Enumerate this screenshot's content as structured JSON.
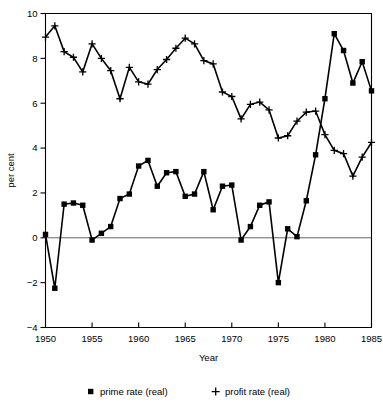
{
  "chart_data": {
    "type": "line",
    "title": "",
    "xlabel": "Year",
    "ylabel": "per cent",
    "xlim": [
      1950,
      1985
    ],
    "ylim": [
      -4,
      10
    ],
    "xticks": [
      1950,
      1955,
      1960,
      1965,
      1970,
      1975,
      1980,
      1985
    ],
    "yticks": [
      -4,
      -2,
      0,
      2,
      4,
      6,
      8,
      10
    ],
    "grid": false,
    "legend_position": "bottom",
    "zero_line": 0,
    "x": [
      1950,
      1951,
      1952,
      1953,
      1954,
      1955,
      1956,
      1957,
      1958,
      1959,
      1960,
      1961,
      1962,
      1963,
      1964,
      1965,
      1966,
      1967,
      1968,
      1969,
      1970,
      1971,
      1972,
      1973,
      1974,
      1975,
      1976,
      1977,
      1978,
      1979,
      1980,
      1981,
      1982,
      1983,
      1984,
      1985
    ],
    "series": [
      {
        "name": "prime rate (real)",
        "marker": "square",
        "values": [
          0.15,
          -2.25,
          1.5,
          1.55,
          1.45,
          -0.1,
          0.2,
          0.5,
          1.75,
          1.95,
          3.2,
          3.45,
          2.3,
          2.9,
          2.95,
          1.85,
          1.95,
          2.95,
          1.25,
          2.3,
          2.35,
          -0.1,
          0.5,
          1.45,
          1.6,
          -2.0,
          0.4,
          0.05,
          1.65,
          3.7,
          6.2,
          9.1,
          8.35,
          6.9,
          7.85,
          6.55
        ]
      },
      {
        "name": "profit rate (real)",
        "marker": "plus",
        "values": [
          8.95,
          9.45,
          8.3,
          8.05,
          7.4,
          8.65,
          8.0,
          7.45,
          6.2,
          7.6,
          6.95,
          6.85,
          7.5,
          7.95,
          8.45,
          8.9,
          8.65,
          7.9,
          7.75,
          6.5,
          6.3,
          5.3,
          5.95,
          6.05,
          5.7,
          4.45,
          4.55,
          5.2,
          5.6,
          5.65,
          4.6,
          3.9,
          3.75,
          2.75,
          3.6,
          4.25
        ]
      }
    ]
  },
  "legend": [
    {
      "marker": "square-marker",
      "label": "prime rate (real)"
    },
    {
      "marker": "plus-marker",
      "label": "profit rate (real)"
    }
  ],
  "colors": {
    "series": "#000000",
    "axis": "#000000",
    "zero_line": "#555555",
    "background": "#ffffff"
  }
}
